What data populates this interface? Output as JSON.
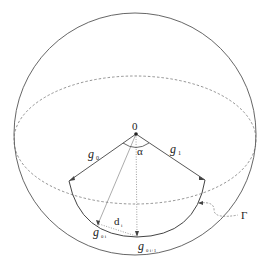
{
  "diagram": {
    "origin_label": "0",
    "angle_label": "α",
    "left_ray_label": "g",
    "left_ray_sub": "0",
    "right_ray_label": "g",
    "right_ray_sub": "1",
    "point1_label": "g",
    "point1_sub": "θ i",
    "point2_label": "g",
    "point2_sub": "θ i+1",
    "distance_label": "d",
    "distance_sub": "i",
    "curve_label": "Γ",
    "caption_partial": "Fig. ..."
  },
  "colors": {
    "line": "#444444",
    "dashed": "#555555",
    "background": "#ffffff"
  }
}
